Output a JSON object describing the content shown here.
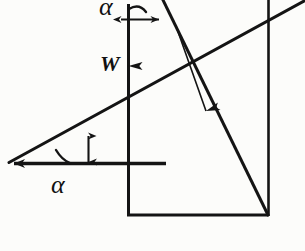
{
  "figure": {
    "name": "inclined-plane-force-diagram",
    "background_color": "#fcfcfa",
    "stroke_color": "#141414",
    "labels": {
      "alpha_top": "α",
      "alpha_bottom": "α",
      "weight": "W"
    },
    "geometry": {
      "apex": [
        8,
        163
      ],
      "incline_end": [
        300,
        2
      ],
      "horizontal_ref_end": [
        166,
        163
      ],
      "weight_line_top": [
        128,
        4
      ],
      "weight_line_bottom": [
        128,
        215
      ],
      "normal_line_top": [
        163,
        0
      ],
      "normal_line_bottom": [
        268,
        215
      ],
      "right_vertical_top": [
        268,
        0
      ],
      "right_vertical_bottom": [
        268,
        215
      ],
      "bottom_horizontal": [
        [
          128,
          215
        ],
        [
          268,
          215
        ]
      ],
      "angle_gap_arrow": [
        [
          88,
          137
        ],
        [
          88,
          163
        ]
      ],
      "top_gap_arrow": [
        [
          120,
          19
        ],
        [
          160,
          19
        ]
      ]
    },
    "annotations": {
      "weight_arrow_direction": "down",
      "normal_arrow_direction": "down-right",
      "horizontal_arrow_direction": "left",
      "angle_symbol": "alpha"
    }
  }
}
